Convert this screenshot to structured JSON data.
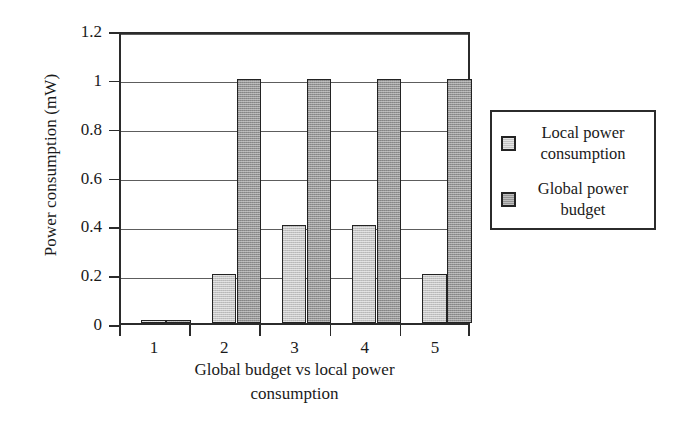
{
  "chart_data": {
    "type": "bar",
    "title": "",
    "xlabel": "Global budget vs local power consumption",
    "ylabel": "Power consumption (mW)",
    "categories": [
      "1",
      "2",
      "3",
      "4",
      "5"
    ],
    "series": [
      {
        "name": "Local power consumption",
        "values": [
          0.01,
          0.2,
          0.4,
          0.4,
          0.2
        ],
        "color": "#c3c3c3"
      },
      {
        "name": "Global power budget",
        "values": [
          0.01,
          1.0,
          1.0,
          1.0,
          1.0
        ],
        "color": "#949494"
      }
    ],
    "ylim": [
      0,
      1.2
    ],
    "yticks": [
      "0",
      "0.2",
      "0.4",
      "0.6",
      "0.8",
      "1",
      "1.2"
    ],
    "ytick_values": [
      0,
      0.2,
      0.4,
      0.6,
      0.8,
      1.0,
      1.2
    ],
    "grid": "horizontal",
    "legend_position": "right-outside",
    "legend": [
      {
        "label_line1": "Local power",
        "label_line2": "consumption"
      },
      {
        "label_line1": "Global power",
        "label_line2": "budget"
      }
    ]
  },
  "axis": {
    "y_title": "Power consumption (mW)",
    "x_title_line1": "Global budget vs local power",
    "x_title_line2": "consumption"
  }
}
